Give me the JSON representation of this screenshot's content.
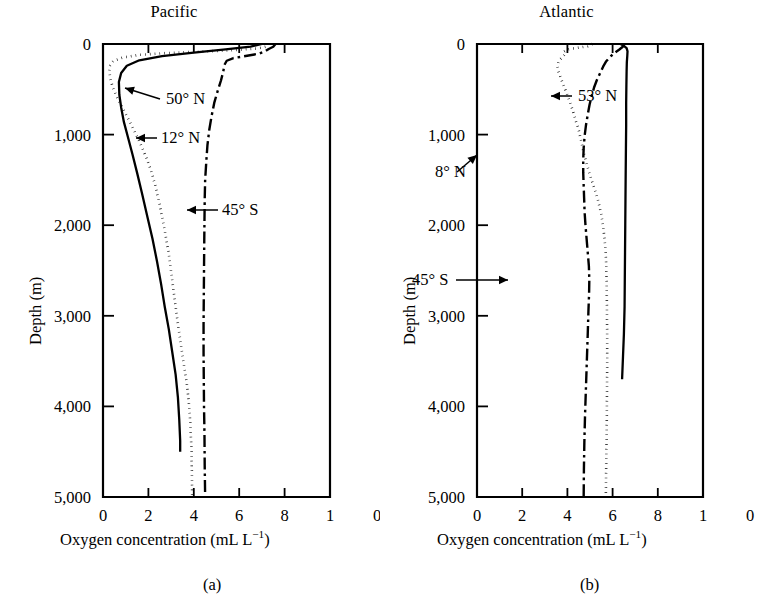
{
  "figure": {
    "ylabel": "Depth (m)",
    "xlabel_main": "Oxygen concentration (mL L",
    "xlabel_exp": "−1",
    "xlabel_close": ")"
  },
  "panels": [
    {
      "id": "pacific",
      "title": "Pacific",
      "caption": "(a)",
      "xlabel": "Oxygen concentration (mL L−1)",
      "ylabel": "Depth (m)"
    },
    {
      "id": "atlantic",
      "title": "Atlantic",
      "caption": "(b)",
      "xlabel": "Oxygen concentration (mL L−1)",
      "ylabel": "Depth (m)"
    }
  ],
  "axes": {
    "x_ticks": [
      0,
      2,
      4,
      6,
      8,
      10
    ],
    "x_tick_labels": [
      "0",
      "2",
      "4",
      "6",
      "8",
      "1",
      "0"
    ],
    "y_ticks": [
      0,
      1000,
      2000,
      3000,
      4000,
      5000
    ],
    "y_tick_labels": [
      "0",
      "1,000",
      "2,000",
      "3,000",
      "4,000",
      "5,000"
    ],
    "xlim": [
      0,
      10
    ],
    "ylim": [
      0,
      5000
    ],
    "y_inverted": true,
    "grid": false
  },
  "chart_data": {
    "type": "line",
    "xlabel": "Oxygen concentration (mL L−1)",
    "ylabel": "Depth (m)",
    "xlim": [
      0,
      10
    ],
    "ylim": [
      0,
      5000
    ],
    "y_inverted": true,
    "grid": false,
    "legend": "inline annotations with leader arrows",
    "panels": [
      {
        "name": "Pacific",
        "caption": "(a)",
        "series": [
          {
            "name": "50° N",
            "style": "solid",
            "label_position": "inside-upper-left",
            "points": [
              [
                7.0,
                0
              ],
              [
                6.5,
                30
              ],
              [
                5.4,
                60
              ],
              [
                4.0,
                95
              ],
              [
                2.6,
                135
              ],
              [
                1.6,
                180
              ],
              [
                1.05,
                240
              ],
              [
                0.8,
                320
              ],
              [
                0.7,
                420
              ],
              [
                0.72,
                560
              ],
              [
                0.8,
                700
              ],
              [
                0.92,
                860
              ],
              [
                1.1,
                1030
              ],
              [
                1.3,
                1220
              ],
              [
                1.5,
                1420
              ],
              [
                1.72,
                1650
              ],
              [
                1.95,
                1900
              ],
              [
                2.18,
                2150
              ],
              [
                2.38,
                2400
              ],
              [
                2.56,
                2650
              ],
              [
                2.72,
                2900
              ],
              [
                2.9,
                3150
              ],
              [
                3.05,
                3400
              ],
              [
                3.2,
                3650
              ],
              [
                3.3,
                3900
              ],
              [
                3.36,
                4150
              ],
              [
                3.4,
                4380
              ],
              [
                3.4,
                4500
              ]
            ]
          },
          {
            "name": "12° N",
            "style": "dotted",
            "label_position": "inside-left-mid",
            "points": [
              [
                7.3,
                0
              ],
              [
                7.25,
                25
              ],
              [
                6.8,
                50
              ],
              [
                5.6,
                70
              ],
              [
                4.2,
                85
              ],
              [
                2.8,
                100
              ],
              [
                1.6,
                120
              ],
              [
                0.85,
                150
              ],
              [
                0.45,
                190
              ],
              [
                0.3,
                240
              ],
              [
                0.28,
                300
              ],
              [
                0.32,
                380
              ],
              [
                0.42,
                470
              ],
              [
                0.6,
                580
              ],
              [
                0.85,
                700
              ],
              [
                1.1,
                820
              ],
              [
                1.38,
                960
              ],
              [
                1.65,
                1100
              ],
              [
                1.9,
                1250
              ],
              [
                2.12,
                1400
              ],
              [
                2.3,
                1560
              ],
              [
                2.45,
                1720
              ],
              [
                2.6,
                1900
              ],
              [
                2.75,
                2100
              ],
              [
                2.9,
                2320
              ],
              [
                3.02,
                2550
              ],
              [
                3.15,
                2800
              ],
              [
                3.28,
                3050
              ],
              [
                3.42,
                3300
              ],
              [
                3.55,
                3520
              ],
              [
                3.68,
                3720
              ],
              [
                3.78,
                3950
              ],
              [
                3.85,
                4200
              ],
              [
                3.9,
                4500
              ],
              [
                3.92,
                4800
              ],
              [
                3.93,
                5000
              ]
            ]
          },
          {
            "name": "45° S",
            "style": "dashdot",
            "label_position": "inside-right-mid",
            "points": [
              [
                7.6,
                0
              ],
              [
                7.5,
                30
              ],
              [
                7.3,
                55
              ],
              [
                7.15,
                80
              ],
              [
                6.9,
                105
              ],
              [
                6.35,
                130
              ],
              [
                5.75,
                155
              ],
              [
                5.45,
                185
              ],
              [
                5.35,
                230
              ],
              [
                5.3,
                300
              ],
              [
                5.2,
                400
              ],
              [
                5.05,
                520
              ],
              [
                4.9,
                650
              ],
              [
                4.78,
                800
              ],
              [
                4.68,
                950
              ],
              [
                4.6,
                1120
              ],
              [
                4.55,
                1300
              ],
              [
                4.5,
                1500
              ],
              [
                4.48,
                1720
              ],
              [
                4.47,
                1950
              ],
              [
                4.46,
                2200
              ],
              [
                4.45,
                2500
              ],
              [
                4.44,
                2800
              ],
              [
                4.43,
                3100
              ],
              [
                4.43,
                3400
              ],
              [
                4.44,
                3700
              ],
              [
                4.45,
                4000
              ],
              [
                4.47,
                4300
              ],
              [
                4.48,
                4650
              ],
              [
                4.5,
                5000
              ]
            ]
          }
        ]
      },
      {
        "name": "Atlantic",
        "caption": "(b)",
        "series": [
          {
            "name": "53° N",
            "style": "solid",
            "label_position": "inside-right-upper",
            "points": [
              [
                6.35,
                0
              ],
              [
                6.5,
                20
              ],
              [
                6.62,
                45
              ],
              [
                6.66,
                80
              ],
              [
                6.65,
                130
              ],
              [
                6.63,
                200
              ],
              [
                6.62,
                300
              ],
              [
                6.61,
                450
              ],
              [
                6.6,
                650
              ],
              [
                6.6,
                900
              ],
              [
                6.59,
                1150
              ],
              [
                6.58,
                1400
              ],
              [
                6.57,
                1700
              ],
              [
                6.56,
                2000
              ],
              [
                6.55,
                2300
              ],
              [
                6.54,
                2600
              ],
              [
                6.53,
                2900
              ],
              [
                6.5,
                3200
              ],
              [
                6.46,
                3450
              ],
              [
                6.42,
                3700
              ]
            ]
          },
          {
            "name": "8° N",
            "style": "dotted",
            "label_position": "inside-left-mid",
            "points": [
              [
                5.1,
                0
              ],
              [
                4.9,
                25
              ],
              [
                4.35,
                45
              ],
              [
                4.0,
                60
              ],
              [
                3.85,
                85
              ],
              [
                3.9,
                110
              ],
              [
                3.78,
                145
              ],
              [
                3.62,
                185
              ],
              [
                3.55,
                240
              ],
              [
                3.6,
                300
              ],
              [
                3.7,
                370
              ],
              [
                3.82,
                450
              ],
              [
                3.95,
                530
              ],
              [
                4.08,
                620
              ],
              [
                4.22,
                720
              ],
              [
                4.35,
                830
              ],
              [
                4.5,
                950
              ],
              [
                4.62,
                1080
              ],
              [
                4.72,
                1200
              ],
              [
                4.85,
                1320
              ],
              [
                5.0,
                1450
              ],
              [
                5.18,
                1580
              ],
              [
                5.35,
                1720
              ],
              [
                5.5,
                1880
              ],
              [
                5.6,
                2050
              ],
              [
                5.68,
                2250
              ],
              [
                5.72,
                2450
              ],
              [
                5.74,
                2700
              ],
              [
                5.75,
                2950
              ],
              [
                5.76,
                3250
              ],
              [
                5.76,
                3550
              ],
              [
                5.75,
                3900
              ],
              [
                5.74,
                4250
              ],
              [
                5.72,
                4600
              ],
              [
                5.7,
                5000
              ]
            ]
          },
          {
            "name": "45° S",
            "style": "dashdot",
            "label_position": "inside-left-lower",
            "points": [
              [
                6.5,
                0
              ],
              [
                6.45,
                30
              ],
              [
                6.3,
                60
              ],
              [
                6.1,
                95
              ],
              [
                5.9,
                140
              ],
              [
                5.72,
                190
              ],
              [
                5.58,
                250
              ],
              [
                5.45,
                320
              ],
              [
                5.3,
                400
              ],
              [
                5.18,
                480
              ],
              [
                5.08,
                570
              ],
              [
                4.98,
                670
              ],
              [
                4.9,
                780
              ],
              [
                4.82,
                900
              ],
              [
                4.76,
                1020
              ],
              [
                4.72,
                1150
              ],
              [
                4.7,
                1280
              ],
              [
                4.7,
                1420
              ],
              [
                4.72,
                1560
              ],
              [
                4.74,
                1700
              ],
              [
                4.76,
                1850
              ],
              [
                4.8,
                2000
              ],
              [
                4.85,
                2150
              ],
              [
                4.9,
                2300
              ],
              [
                4.95,
                2450
              ],
              [
                4.97,
                2600
              ],
              [
                4.96,
                2750
              ],
              [
                4.93,
                2950
              ],
              [
                4.9,
                3200
              ],
              [
                4.86,
                3500
              ],
              [
                4.82,
                3800
              ],
              [
                4.78,
                4100
              ],
              [
                4.75,
                4400
              ],
              [
                4.73,
                4700
              ],
              [
                4.72,
                5000
              ]
            ]
          }
        ]
      }
    ]
  },
  "annotations": {
    "pacific": [
      {
        "text": "50° N",
        "series": "50° N"
      },
      {
        "text": "12° N",
        "series": "12° N"
      },
      {
        "text": "45° S",
        "series": "45° S"
      }
    ],
    "atlantic": [
      {
        "text": "53° N",
        "series": "53° N"
      },
      {
        "text": "8° N",
        "series": "8° N"
      },
      {
        "text": "45° S",
        "series": "45° S"
      }
    ]
  }
}
